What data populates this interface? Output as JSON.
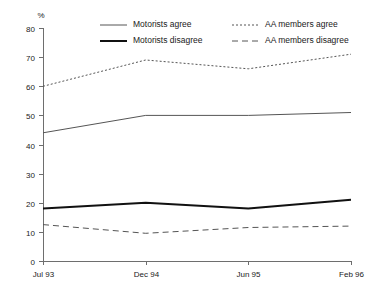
{
  "chart_data": {
    "type": "line",
    "title": "",
    "subtitle": "",
    "xlabel": "",
    "ylabel": "%",
    "unit_label": "%",
    "categories": [
      "Jul 93",
      "Dec 94",
      "Jun 95",
      "Feb 96"
    ],
    "x": [
      "Jul 93",
      "Dec 94",
      "Jun 95",
      "Feb 96"
    ],
    "ylim": [
      0,
      80
    ],
    "yticks": [
      0,
      10,
      20,
      30,
      40,
      50,
      60,
      70,
      80
    ],
    "ytick_labels": [
      "0",
      "10",
      "20",
      "30",
      "40",
      "50",
      "60",
      "70",
      "80"
    ],
    "grid": false,
    "legend_position": "top",
    "series": [
      {
        "name": "Motorists agree",
        "values": [
          44,
          50,
          50,
          51
        ],
        "style": "solid",
        "width": 1,
        "color": "#555555"
      },
      {
        "name": "Motorists disagree",
        "values": [
          18,
          20,
          18,
          21
        ],
        "style": "solid",
        "width": 2,
        "color": "#111111"
      },
      {
        "name": "AA members agree",
        "values": [
          60,
          69,
          66,
          71
        ],
        "style": "dotted",
        "width": 1,
        "color": "#555555"
      },
      {
        "name": "AA members disagree",
        "values": [
          12.5,
          9.5,
          11.5,
          12
        ],
        "style": "dashed",
        "width": 1,
        "color": "#555555"
      }
    ]
  },
  "legend": {
    "entries": [
      {
        "label": "Motorists agree"
      },
      {
        "label": "AA members agree"
      },
      {
        "label": "Motorists disagree"
      },
      {
        "label": "AA members disagree"
      }
    ]
  }
}
